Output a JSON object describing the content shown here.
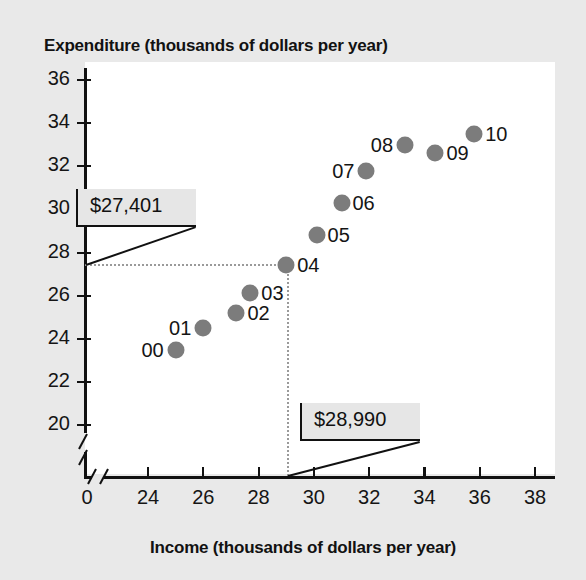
{
  "chart_data": {
    "type": "scatter",
    "title": "",
    "xlabel": "Income (thousands of dollars per year)",
    "ylabel": "Expenditure (thousands of dollars per year)",
    "xlim": [
      23,
      39
    ],
    "ylim": [
      19,
      37
    ],
    "xticks": [
      "0",
      "24",
      "26",
      "28",
      "30",
      "32",
      "34",
      "36",
      "38"
    ],
    "yticks": [
      "36",
      "34",
      "32",
      "30",
      "28",
      "26",
      "24",
      "22",
      "20"
    ],
    "grid": false,
    "legend": "none",
    "axis_break_x": true,
    "axis_break_y": true,
    "marker_color": "#7c7c7c",
    "points": [
      {
        "label": "00",
        "x": 25.0,
        "y": 23.5,
        "label_side": "left"
      },
      {
        "label": "01",
        "x": 26.0,
        "y": 24.5,
        "label_side": "left"
      },
      {
        "label": "02",
        "x": 27.2,
        "y": 25.2,
        "label_side": "right"
      },
      {
        "label": "03",
        "x": 27.7,
        "y": 26.1,
        "label_side": "right"
      },
      {
        "label": "04",
        "x": 29.0,
        "y": 27.4,
        "label_side": "right"
      },
      {
        "label": "05",
        "x": 30.1,
        "y": 28.8,
        "label_side": "right"
      },
      {
        "label": "06",
        "x": 31.0,
        "y": 30.3,
        "label_side": "right"
      },
      {
        "label": "07",
        "x": 31.9,
        "y": 31.8,
        "label_side": "left"
      },
      {
        "label": "08",
        "x": 33.3,
        "y": 33.0,
        "label_side": "left"
      },
      {
        "label": "09",
        "x": 34.4,
        "y": 32.6,
        "label_side": "right"
      },
      {
        "label": "10",
        "x": 35.8,
        "y": 33.5,
        "label_side": "right"
      }
    ],
    "annotations": [
      {
        "name": "expenditure-callout",
        "text": "$27,401",
        "points_to": {
          "x": 29.0,
          "y": 27.4
        },
        "axis": "y"
      },
      {
        "name": "income-callout",
        "text": "$28,990",
        "points_to": {
          "x": 29.0,
          "y": 27.4
        },
        "axis": "x"
      }
    ],
    "guides": {
      "horizontal_value": 27.4,
      "vertical_value": 29.0
    }
  }
}
